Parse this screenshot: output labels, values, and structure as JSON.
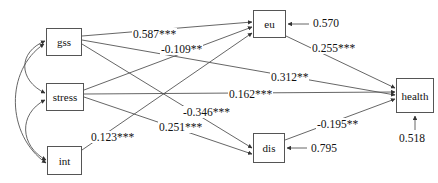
{
  "diagram": {
    "stroke_color": "#555555",
    "text_color": "#111111",
    "background": "#ffffff",
    "nodes": [
      {
        "id": "gss",
        "label": "gss",
        "x": 46,
        "y": 28,
        "w": 36,
        "h": 28
      },
      {
        "id": "stress",
        "label": "stress",
        "x": 46,
        "y": 83,
        "w": 38,
        "h": 28
      },
      {
        "id": "int",
        "label": "int",
        "x": 47,
        "y": 146,
        "w": 35,
        "h": 29
      },
      {
        "id": "eu",
        "label": "eu",
        "x": 253,
        "y": 10,
        "w": 33,
        "h": 28
      },
      {
        "id": "dis",
        "label": "dis",
        "x": 253,
        "y": 133,
        "w": 32,
        "h": 30
      },
      {
        "id": "health",
        "label": "health",
        "x": 396,
        "y": 78,
        "w": 38,
        "h": 35
      }
    ],
    "edges": [
      {
        "from": "gss",
        "to": "eu",
        "label": "0.587***",
        "label_x": 132,
        "label_y": 28
      },
      {
        "from": "stress",
        "to": "eu",
        "label": "-0.109**",
        "label_x": 160,
        "label_y": 43
      },
      {
        "from": "eu",
        "to": "health",
        "label": "0.255***",
        "label_x": 311,
        "label_y": 42
      },
      {
        "from": "gss",
        "to": "health",
        "label": "0.312**",
        "label_x": 270,
        "label_y": 71
      },
      {
        "from": "stress",
        "to": "health",
        "label": "0.162***",
        "label_x": 228,
        "label_y": 88
      },
      {
        "from": "gss",
        "to": "dis",
        "label": "-0.346***",
        "label_x": 182,
        "label_y": 106
      },
      {
        "from": "stress",
        "to": "dis",
        "label": "0.251***",
        "label_x": 158,
        "label_y": 121
      },
      {
        "from": "int",
        "to": "eu",
        "label": "0.123***",
        "label_x": 90,
        "label_y": 131
      },
      {
        "from": "dis",
        "to": "health",
        "label": "-0.195**",
        "label_x": 316,
        "label_y": 118
      }
    ],
    "residuals": [
      {
        "to": "eu",
        "label": "0.570",
        "label_x": 312,
        "label_y": 17
      },
      {
        "to": "dis",
        "label": "0.795",
        "label_x": 310,
        "label_y": 142
      },
      {
        "to": "health",
        "label": "0.518",
        "label_x": 398,
        "label_y": 132
      }
    ],
    "covariances": [
      {
        "between": [
          "gss",
          "stress"
        ],
        "label": ""
      },
      {
        "between": [
          "stress",
          "int"
        ],
        "label": ""
      },
      {
        "between": [
          "gss",
          "int"
        ],
        "label": ""
      }
    ]
  }
}
